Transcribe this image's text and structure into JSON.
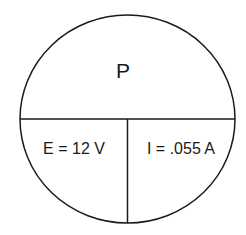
{
  "diagram": {
    "title_section": {
      "label": "P"
    },
    "left_section": {
      "label": "E = 12 V"
    },
    "right_section": {
      "label": "I = .055 A"
    },
    "stroke_color": "#1a1a1a"
  }
}
